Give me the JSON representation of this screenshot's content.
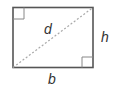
{
  "diagram": {
    "labels": {
      "diagonal": "d",
      "height": "h",
      "base": "b"
    },
    "colors": {
      "outline": "#555555",
      "diagonal": "#aaaaaa",
      "text": "#333333"
    }
  }
}
